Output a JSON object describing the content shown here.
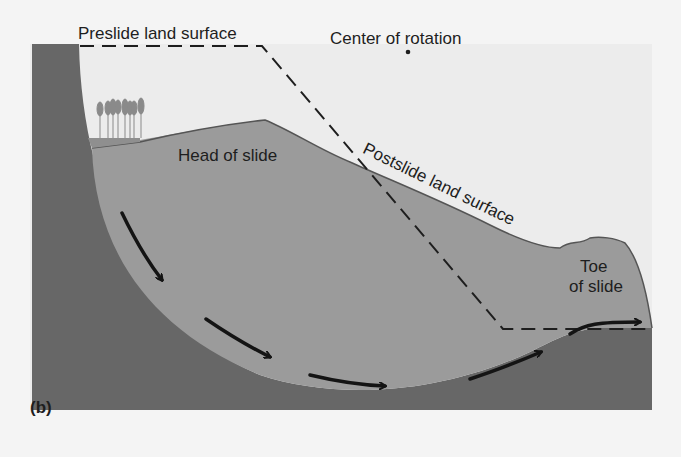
{
  "figure": {
    "panel_label": "(b)",
    "labels": {
      "preslide": "Preslide land surface",
      "center": "Center of rotation",
      "head": "Head of slide",
      "postslide": "Postslide land surface",
      "toe_line1": "Toe",
      "toe_line2": "of slide"
    },
    "colors": {
      "background": "#f4f4f4",
      "sky": "#ebebeb",
      "bedrock": "#666666",
      "slide_mass": "#9a9a9a",
      "ground_line": "#555555",
      "arrow": "#141414",
      "dashed_line": "#1e1e1e",
      "tree": "#8a8a8a"
    },
    "elements": {
      "center_point": "center-of-rotation-dot",
      "arrows": [
        "slip-arrow-1",
        "slip-arrow-2",
        "slip-arrow-3",
        "slip-arrow-4",
        "slip-arrow-5"
      ],
      "trees": "tree-cluster"
    }
  }
}
